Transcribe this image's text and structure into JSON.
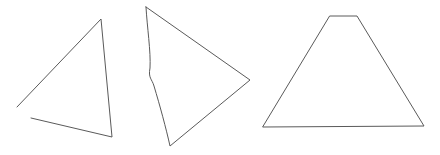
{
  "canvas": {
    "width": 440,
    "height": 155,
    "background_color": "#ffffff",
    "stroke_color": "#5a5a5a",
    "stroke_width": 1
  },
  "figure": {
    "shape_count": 3,
    "shapes": [
      {
        "id": "shape-1",
        "name": "open-triangle-left",
        "description": "Scalene triangle outline with a gap at the left vertex",
        "closed": false,
        "vertices": [
          [
            17,
            107
          ],
          [
            101,
            19
          ],
          [
            112,
            137
          ],
          [
            31,
            118
          ]
        ],
        "path": "M 17 107 L 101 19 L 112 137 L 31 118",
        "stroke_color": "#5a5a5a",
        "stroke_width": 1
      },
      {
        "id": "shape-2",
        "name": "curved-edge-triangle-middle",
        "description": "Triangle pointing right with a wavy S-curved left edge",
        "closed": true,
        "vertices": [
          [
            146,
            7
          ],
          [
            250,
            80
          ],
          [
            170,
            146
          ]
        ],
        "path": "M 146 7 L 250 80 L 170 146 C 166 128 160 106 154 86 C 152 79 148 78 150 68 C 151 52 147 26 146 7 Z",
        "stroke_color": "#5a5a5a",
        "stroke_width": 1
      },
      {
        "id": "shape-3",
        "name": "trapezoid-right",
        "description": "Symmetric trapezoid with flat narrow top and wide base",
        "closed": true,
        "vertices": [
          [
            330,
            16
          ],
          [
            357,
            16
          ],
          [
            424,
            126
          ],
          [
            263,
            127
          ]
        ],
        "path": "M 330 16 L 357 16 L 424 126 L 263 127 Z",
        "stroke_color": "#5a5a5a",
        "stroke_width": 1
      }
    ]
  }
}
